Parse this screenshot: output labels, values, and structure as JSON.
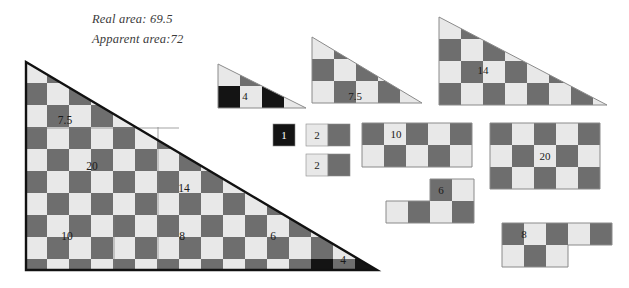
{
  "figure": {
    "title_lines": [
      "Real area: 69.5",
      "Apparent area:72"
    ],
    "type": "missing-square-puzzle-dissection",
    "colors": {
      "light": "#e8e8e8",
      "dark": "#6e6e6e",
      "black": "#141414",
      "outline": "#8a8a8a",
      "border": "#111111",
      "background": "#ffffff",
      "text": "#1a1a1a",
      "header_text": "#3a3a3a"
    },
    "grid": {
      "cell_px": 22,
      "note": "checkerboard alternating light/dark squares"
    }
  },
  "pieces": [
    {
      "id": "main-triangle",
      "label": "",
      "shape": "right-triangle",
      "cols": 16,
      "rows": 9.5,
      "area_label": "",
      "sub_labels": [
        "7.5",
        "20",
        "14",
        "10",
        "8",
        "6",
        "4"
      ]
    },
    {
      "id": "triangle-4",
      "label": "4",
      "shape": "right-triangle",
      "cols": 3,
      "rows": 2
    },
    {
      "id": "triangle-7point5",
      "label": "7.5",
      "shape": "right-triangle",
      "cols": 4,
      "rows": 3
    },
    {
      "id": "triangle-14",
      "label": "14",
      "shape": "right-triangle",
      "cols": 7,
      "rows": 4
    },
    {
      "id": "square-1",
      "label": "1",
      "shape": "square",
      "cols": 1,
      "rows": 1
    },
    {
      "id": "rect-2-upper",
      "label": "2",
      "shape": "rectangle",
      "cols": 2,
      "rows": 1
    },
    {
      "id": "rect-2-lower",
      "label": "2",
      "shape": "rectangle",
      "cols": 2,
      "rows": 1
    },
    {
      "id": "rect-10",
      "label": "10",
      "shape": "rectangle",
      "cols": 5,
      "rows": 2
    },
    {
      "id": "rect-20",
      "label": "20",
      "shape": "rectangle",
      "cols": 5,
      "rows": 3
    },
    {
      "id": "lshape-6",
      "label": "6",
      "shape": "L-shape",
      "cols": 4,
      "rows": 2
    },
    {
      "id": "lshape-8",
      "label": "8",
      "shape": "L-shape",
      "cols": 5,
      "rows": 2
    }
  ],
  "labels": {
    "main_7point5": "7.5",
    "main_20": "20",
    "main_14": "14",
    "main_10": "10",
    "main_8": "8",
    "main_6": "6",
    "main_4": "4",
    "tri_4": "4",
    "tri_7point5": "7.5",
    "tri_14": "14",
    "sq_1": "1",
    "rect_2a": "2",
    "rect_2b": "2",
    "rect_10": "10",
    "rect_20": "20",
    "l_6": "6",
    "l_8": "8"
  }
}
